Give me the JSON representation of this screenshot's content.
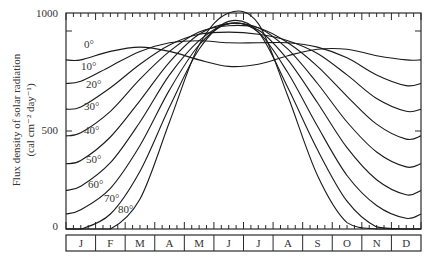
{
  "chart_data": {
    "type": "line",
    "title": "",
    "xlabel": "",
    "ylabel": "Flux density of solar radiation",
    "ylabel_units": "(cal cm⁻² day⁻¹)",
    "ylim": [
      0,
      1000
    ],
    "yticks": [
      0,
      500,
      1000
    ],
    "grid": false,
    "legend": "inline labels at left",
    "categories": [
      "J",
      "F",
      "M",
      "A",
      "M",
      "J",
      "J",
      "A",
      "S",
      "O",
      "N",
      "D"
    ],
    "series": [
      {
        "name": "0°",
        "values": [
          790,
          830,
          850,
          830,
          790,
          760,
          770,
          810,
          840,
          840,
          810,
          790
        ]
      },
      {
        "name": "10°",
        "values": [
          690,
          760,
          830,
          870,
          880,
          870,
          870,
          870,
          850,
          800,
          720,
          670
        ]
      },
      {
        "name": "20°",
        "values": [
          570,
          660,
          770,
          860,
          910,
          920,
          910,
          880,
          820,
          720,
          610,
          550
        ]
      },
      {
        "name": "30°",
        "values": [
          450,
          550,
          700,
          830,
          920,
          950,
          940,
          870,
          760,
          620,
          490,
          420
        ]
      },
      {
        "name": "40°",
        "values": [
          320,
          430,
          600,
          780,
          910,
          960,
          940,
          840,
          680,
          500,
          360,
          290
        ]
      },
      {
        "name": "50°",
        "values": [
          200,
          310,
          500,
          720,
          880,
          960,
          930,
          790,
          590,
          380,
          230,
          160
        ]
      },
      {
        "name": "60°",
        "values": [
          90,
          190,
          390,
          650,
          860,
          960,
          920,
          730,
          480,
          250,
          110,
          50
        ]
      },
      {
        "name": "70°",
        "values": [
          0,
          70,
          270,
          570,
          840,
          970,
          920,
          660,
          370,
          130,
          10,
          0
        ]
      },
      {
        "name": "80°",
        "values": [
          0,
          0,
          140,
          500,
          860,
          1010,
          960,
          620,
          250,
          30,
          0,
          0
        ]
      }
    ]
  },
  "axis": {
    "y_labels": [
      "1000",
      "500",
      "0"
    ],
    "ylabel_line1": "Flux density of solar radiation",
    "ylabel_line2": "(cal cm⁻² day⁻¹)"
  },
  "months": [
    "J",
    "F",
    "M",
    "A",
    "M",
    "J",
    "J",
    "A",
    "S",
    "O",
    "N",
    "D"
  ],
  "latitude_labels": [
    "0°",
    "10°",
    "20°",
    "30°",
    "40°",
    "50°",
    "60°",
    "70°",
    "80°"
  ],
  "colors": {
    "line": "#1a1a1a",
    "frame": "#2a2a2a",
    "background": "#ffffff"
  }
}
